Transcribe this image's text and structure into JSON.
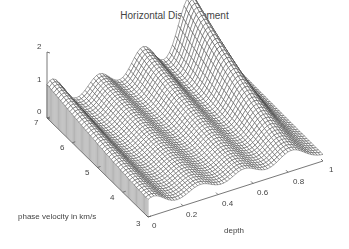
{
  "chart_data": {
    "type": "surface",
    "title": "Horizontal Displacement",
    "xlabel": "depth",
    "ylabel": "phase velocity in km/s",
    "zlabel": "",
    "x_ticks": [
      "0",
      "0.2",
      "0.4",
      "0.6",
      "0.8",
      "1"
    ],
    "y_ticks": [
      "3",
      "4",
      "5",
      "6",
      "7"
    ],
    "z_ticks": [
      "0",
      "1",
      "2"
    ],
    "xlim": [
      0,
      1
    ],
    "ylim": [
      3,
      7
    ],
    "zlim": [
      0,
      2
    ],
    "grid": false,
    "ridges": [
      {
        "depth": 0.03,
        "peak_at_v7": 0.95,
        "peak_at_v3": 0.4
      },
      {
        "depth": 0.3,
        "peak_at_v7": 0.65,
        "peak_at_v3": 0.3
      },
      {
        "depth": 0.55,
        "peak_at_v7": 1.05,
        "peak_at_v3": 0.35
      },
      {
        "depth": 0.82,
        "peak_at_v7": 2.15,
        "peak_at_v3": 0.45
      }
    ]
  },
  "axes": {
    "z": [
      {
        "label": "2"
      },
      {
        "label": "1"
      },
      {
        "label": "0"
      }
    ],
    "y": [
      {
        "label": "7"
      },
      {
        "label": "6"
      },
      {
        "label": "5"
      },
      {
        "label": "4"
      },
      {
        "label": "3"
      }
    ],
    "x": [
      {
        "label": "0"
      },
      {
        "label": "0.2"
      },
      {
        "label": "0.4"
      },
      {
        "label": "0.6"
      },
      {
        "label": "0.8"
      },
      {
        "label": "1"
      }
    ]
  }
}
